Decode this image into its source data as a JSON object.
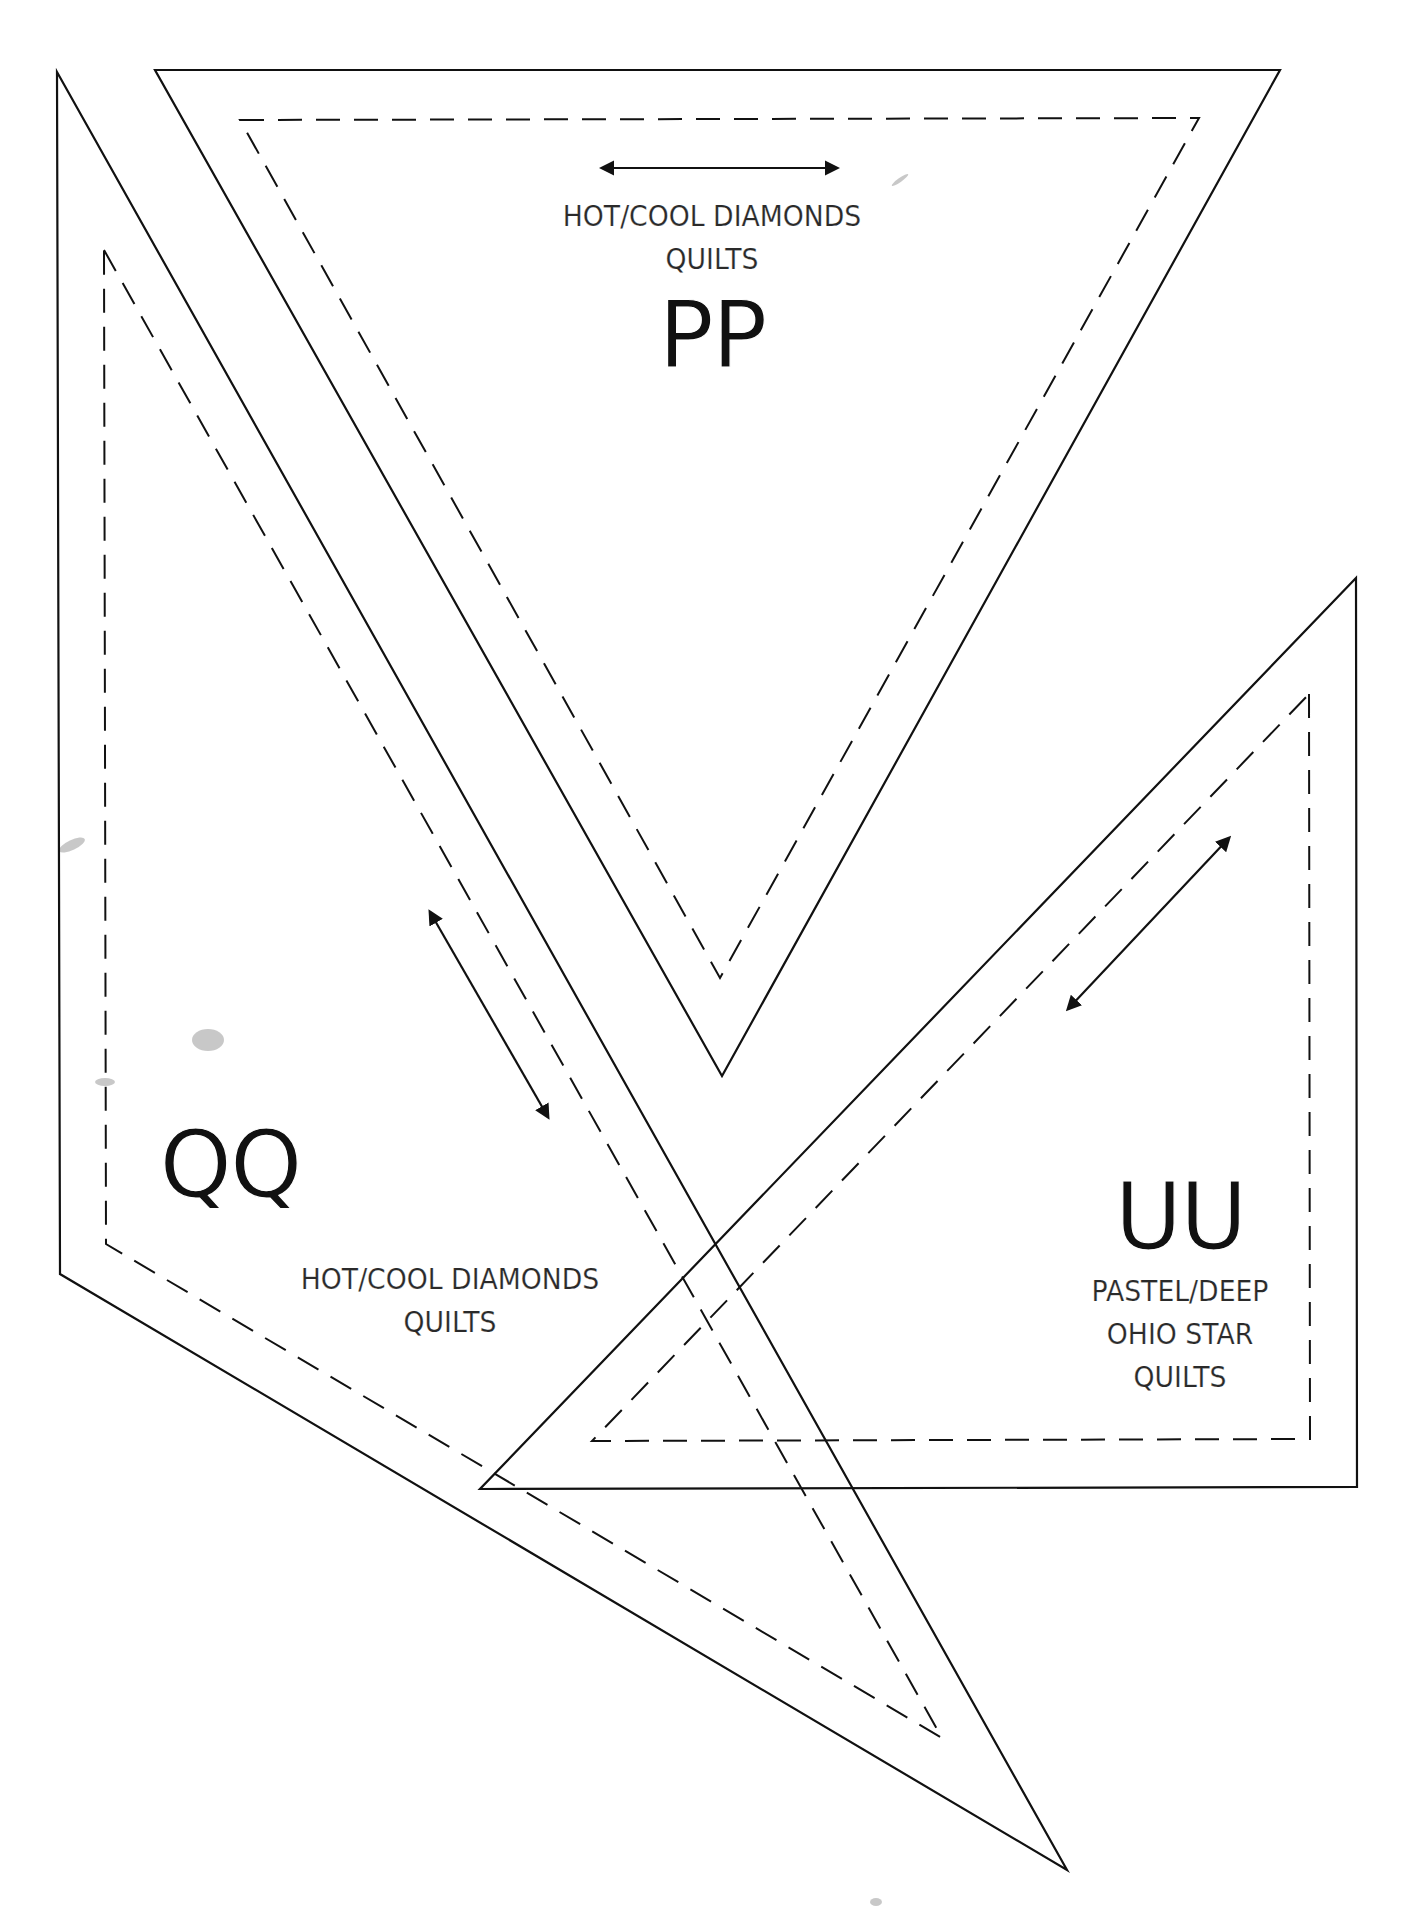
{
  "page": {
    "background": "#ffffff",
    "line_color": "#111111"
  },
  "templates": [
    {
      "id": "PP",
      "code": "PP",
      "title_line1": "HOT/COOL DIAMONDS",
      "title_line2": "QUILTS",
      "shape": "inverted-triangle",
      "cut_line": [
        [
          155,
          70
        ],
        [
          1280,
          70
        ],
        [
          722,
          1076
        ]
      ],
      "seam_line": [
        [
          240,
          120
        ],
        [
          1199,
          118
        ],
        [
          720,
          978
        ]
      ],
      "grain_arrow": {
        "from": [
          602,
          168
        ],
        "to": [
          837,
          168
        ],
        "double_headed": true
      }
    },
    {
      "id": "QQ",
      "code": "QQ",
      "title_line1": "HOT/COOL DIAMONDS",
      "title_line2": "QUILTS",
      "shape": "long-triangle",
      "cut_line": [
        [
          57,
          72
        ],
        [
          1067,
          1870
        ],
        [
          60,
          1274
        ]
      ],
      "seam_line": [
        [
          104,
          250
        ],
        [
          942,
          1738
        ],
        [
          106,
          1244
        ]
      ],
      "grain_arrow": {
        "from": [
          430,
          912
        ],
        "to": [
          548,
          1117
        ],
        "double_headed": true
      }
    },
    {
      "id": "UU",
      "code": "UU",
      "title_line1": "PASTEL/DEEP",
      "title_line2": "OHIO STAR",
      "title_line3": "QUILTS",
      "shape": "right-triangle",
      "cut_line": [
        [
          1356,
          578
        ],
        [
          1357,
          1487
        ],
        [
          480,
          1489
        ]
      ],
      "seam_line": [
        [
          1309,
          694
        ],
        [
          1310,
          1439
        ],
        [
          592,
          1441
        ]
      ],
      "grain_arrow": {
        "from": [
          1229,
          838
        ],
        "to": [
          1068,
          1009
        ],
        "double_headed": true
      }
    }
  ]
}
